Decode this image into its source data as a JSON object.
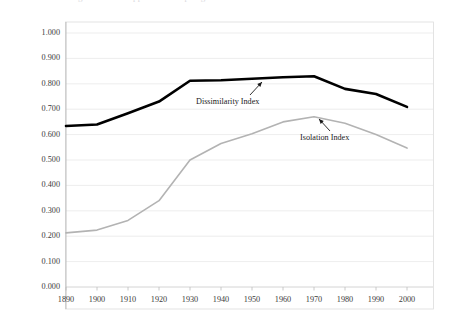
{
  "figure": {
    "clipped_title": "the figure title is clipped at the top edge",
    "background_color": "#ffffff",
    "border_color": "#d6d6d6"
  },
  "annotations": [
    {
      "name": "dissimilarity-index-annotation",
      "label": "Dissimilarity Index",
      "x": 196,
      "y": 97,
      "arrow": {
        "x1": 250,
        "y1": 95,
        "x2": 262,
        "y2": 82
      }
    },
    {
      "name": "isolation-index-annotation",
      "label": "Isolation Index",
      "x": 300,
      "y": 133,
      "arrow": {
        "x1": 330,
        "y1": 131,
        "x2": 319,
        "y2": 119
      }
    }
  ],
  "chart_data": {
    "type": "line",
    "title": "",
    "xlabel": "",
    "ylabel": "",
    "xlim": [
      1890,
      2000
    ],
    "ylim": [
      0.0,
      1.0
    ],
    "grid": true,
    "grid_axis": "y",
    "legend": "inline-annotations",
    "categories": [
      1890,
      1900,
      1910,
      1920,
      1930,
      1940,
      1950,
      1960,
      1970,
      1980,
      1990,
      2000
    ],
    "x_tick_labels": [
      "1890",
      "1900",
      "1910",
      "1920",
      "1930",
      "1940",
      "1950",
      "1960",
      "1970",
      "1980",
      "1990",
      "2000"
    ],
    "y_tick_values": [
      0.0,
      0.1,
      0.2,
      0.3,
      0.4,
      0.5,
      0.6,
      0.7,
      0.8,
      0.9,
      1.0
    ],
    "y_tick_labels": [
      "0.000",
      "0.100",
      "0.200",
      "0.300",
      "0.400",
      "0.500",
      "0.600",
      "0.700",
      "0.800",
      "0.900",
      "1.000"
    ],
    "series": [
      {
        "name": "Dissimilarity Index",
        "color": "#000000",
        "width": 2.6,
        "values": [
          0.634,
          0.64,
          0.684,
          0.73,
          0.812,
          0.814,
          0.82,
          0.826,
          0.83,
          0.78,
          0.76,
          0.709
        ]
      },
      {
        "name": "Isolation Index",
        "color": "#b3b3b3",
        "width": 1.6,
        "values": [
          0.213,
          0.224,
          0.262,
          0.34,
          0.5,
          0.565,
          0.603,
          0.65,
          0.67,
          0.645,
          0.6,
          0.547
        ]
      }
    ]
  }
}
